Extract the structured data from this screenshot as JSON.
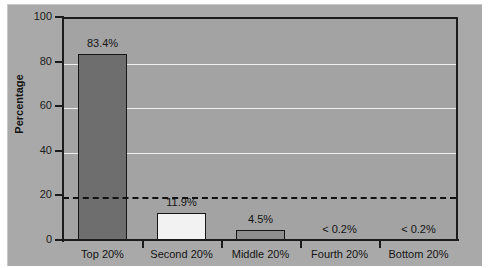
{
  "chart_data": {
    "type": "bar",
    "title": "",
    "subtitle": "",
    "xlabel": "",
    "ylabel": "Percentage",
    "categories": [
      "Top 20%",
      "Second 20%",
      "Middle 20%",
      "Fourth 20%",
      "Bottom 20%"
    ],
    "values": [
      83.4,
      11.9,
      4.5,
      0.1,
      0.1
    ],
    "value_labels": [
      "83.4%",
      "11.9%",
      "4.5%",
      "< 0.2%",
      "< 0.2%"
    ],
    "bar_colors": [
      "#6e6e6e",
      "#f2f2f2",
      "#8e8e8e",
      "#a3a3a3",
      "#a3a3a3"
    ],
    "ylim": [
      0,
      100
    ],
    "yticks": [
      0,
      20,
      40,
      60,
      80,
      100
    ],
    "ytick_labels": [
      "0",
      "20",
      "40",
      "60",
      "80",
      "100"
    ],
    "gridlines": [
      40,
      60,
      80
    ],
    "grid": true,
    "grid_color": "#efefef",
    "legend": "none",
    "annotations": [
      {
        "name": "reference-line",
        "type": "hline",
        "value": 20,
        "style": "dashed",
        "color": "#111111"
      }
    ],
    "plot_background": "#a3a3a3",
    "figure_background": "#a9a9a9",
    "axis_color": "#1c1c1c"
  }
}
